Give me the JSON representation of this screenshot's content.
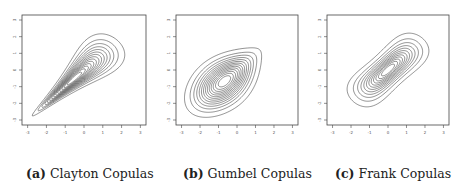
{
  "figure": {
    "panels": [
      {
        "tag": "(a)",
        "label": "Clayton Copulas"
      },
      {
        "tag": "(b)",
        "label": "Gumbel Copulas"
      },
      {
        "tag": "(c)",
        "label": "Frank Copulas"
      }
    ]
  },
  "chart_data": [
    {
      "type": "contour",
      "title": "(a) Clayton Copulas",
      "family": "clayton",
      "theta": 3,
      "margins": "standard normal",
      "xlabel": "",
      "ylabel": "",
      "xlim": [
        -3.3,
        3.3
      ],
      "ylim": [
        -3.3,
        3.3
      ],
      "xticks": [
        -3,
        -2,
        -1,
        0,
        1,
        2,
        3
      ],
      "yticks": [
        -3,
        -2,
        -1,
        0,
        1,
        2,
        3
      ],
      "n_levels": 14,
      "grid": false,
      "shape": "teardrop, tight lower-left tail, peak near (-0.5,-0.4)"
    },
    {
      "type": "contour",
      "title": "(b) Gumbel Copulas",
      "family": "gumbel",
      "theta": 2,
      "margins": "standard normal",
      "xlabel": "",
      "ylabel": "",
      "xlim": [
        -3.3,
        3.3
      ],
      "ylim": [
        -3.3,
        3.3
      ],
      "xticks": [
        -3,
        -2,
        -1,
        0,
        1,
        2,
        3
      ],
      "yticks": [
        -3,
        -2,
        -1,
        0,
        1,
        2,
        3
      ],
      "n_levels": 14,
      "grid": false,
      "shape": "teardrop, tight upper-right tail, peak near (0.1,0.1)"
    },
    {
      "type": "contour",
      "title": "(c) Frank Copulas",
      "family": "frank",
      "theta": 6,
      "margins": "standard normal",
      "xlabel": "",
      "ylabel": "",
      "xlim": [
        -3.3,
        3.3
      ],
      "ylim": [
        -3.3,
        3.3
      ],
      "xticks": [
        -3,
        -2,
        -1,
        0,
        1,
        2,
        3
      ],
      "yticks": [
        -3,
        -2,
        -1,
        0,
        1,
        2,
        3
      ],
      "n_levels": 12,
      "grid": false,
      "shape": "symmetric elongated ellipse along diagonal, peak at (0,0)"
    }
  ],
  "layout": {
    "panels": [
      {
        "frame": [
          22,
          15,
          146,
          125
        ]
      },
      {
        "frame": [
          176,
          15,
          298,
          125
        ]
      },
      {
        "frame": [
          327,
          15,
          449,
          125
        ]
      }
    ],
    "captions_x": [
      26,
      183,
      335
    ]
  }
}
